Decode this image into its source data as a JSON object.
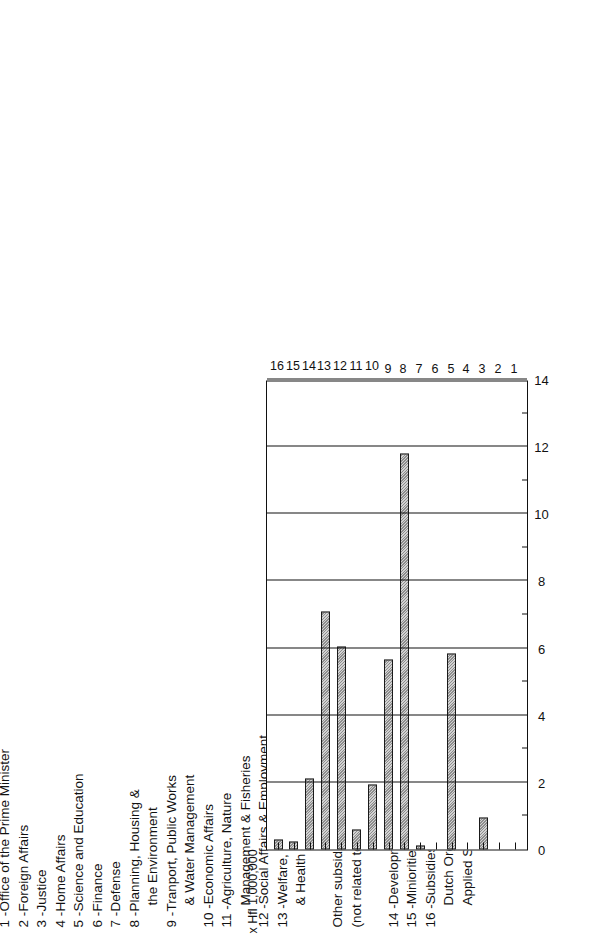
{
  "chart_data": {
    "type": "bar",
    "orientation": "horizontal",
    "title": "",
    "xlabel": "x Hfl 1,000,000",
    "ylabel": "",
    "unit_caption": "x Hfl 1,000,000",
    "xlim": [
      0,
      14
    ],
    "xticks": [
      0,
      2,
      4,
      6,
      8,
      10,
      12,
      14
    ],
    "xtick_labels": [
      "0",
      "2",
      "4",
      "6",
      "8",
      "10",
      "12",
      "14"
    ],
    "minor_tick_step": 1,
    "grid": true,
    "legend_position": "above",
    "categories": [
      "1",
      "2",
      "3",
      "4",
      "5",
      "6",
      "7",
      "8",
      "9",
      "10",
      "11",
      "12",
      "13",
      "14",
      "15",
      "16"
    ],
    "values": [
      0,
      0,
      0.95,
      0,
      5.85,
      0,
      0.12,
      11.8,
      5.65,
      1.95,
      0.6,
      6.05,
      7.1,
      2.1,
      0.25,
      0.3
    ]
  },
  "axis": {
    "unit_caption": "x Hfl 1,000,000",
    "value_ticks": [
      "14",
      "12",
      "10",
      "8",
      "6",
      "4",
      "2",
      "0"
    ],
    "category_ticks": [
      "1",
      "2",
      "3",
      "4",
      "5",
      "6",
      "7",
      "8",
      "9",
      "10",
      "11",
      "12",
      "13",
      "14",
      "15",
      "16"
    ]
  },
  "legend": {
    "entries": [
      {
        "num": "1 -",
        "lines": [
          "Office of the Prime Minister"
        ]
      },
      {
        "num": "2 -",
        "lines": [
          "Foreign Affairs"
        ]
      },
      {
        "num": "3 -",
        "lines": [
          "Justice"
        ]
      },
      {
        "num": "4 -",
        "lines": [
          "Home Affairs"
        ]
      },
      {
        "num": "5 -",
        "lines": [
          "Science and Education"
        ]
      },
      {
        "num": "6 -",
        "lines": [
          "Finance"
        ]
      },
      {
        "num": "7 -",
        "lines": [
          "Defense"
        ]
      },
      {
        "num": "8 -",
        "lines": [
          "Planning, Housing &",
          "the Environment"
        ]
      },
      {
        "num": "9 -",
        "lines": [
          "Tranport, Public Works",
          "& Water Management"
        ]
      },
      {
        "num": "10 -",
        "lines": [
          "Economic Affairs"
        ]
      },
      {
        "num": "11 -",
        "lines": [
          "Agriculture, Nature",
          "Management &  Fisheries"
        ]
      },
      {
        "num": "12 -",
        "lines": [
          "Social Affairs & Employment"
        ]
      },
      {
        "num": "13 -",
        "lines": [
          "Welfare, Cultural Affairs",
          "& Health"
        ]
      }
    ],
    "other_heading": "Other subsidies",
    "other_subheading": "(not related to a specific ministry)",
    "other_entries": [
      {
        "num": "14 -",
        "lines": [
          "Development Aid"
        ]
      },
      {
        "num": "15 -",
        "lines": [
          "Miniorities"
        ]
      },
      {
        "num": "16 -",
        "lines": [
          "Subsidies on behalf of the",
          "Dutch Organization for",
          "Applied Scientific Research"
        ]
      }
    ]
  }
}
